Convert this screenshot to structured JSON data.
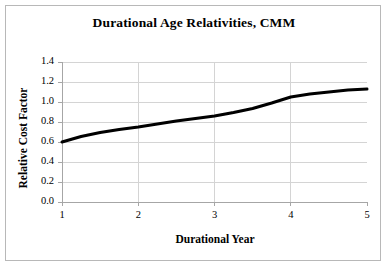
{
  "chart_data": {
    "type": "line",
    "title": "Durational Age Relativities, CMM",
    "xlabel": "Durational Year",
    "ylabel": "Relative Cost Factor",
    "xlim": [
      1,
      5
    ],
    "ylim": [
      0.0,
      1.4
    ],
    "grid": true,
    "legend": null,
    "xticks": [
      "1",
      "2",
      "3",
      "4",
      "5"
    ],
    "xtick_values": [
      1,
      2,
      3,
      4,
      5
    ],
    "yticks": [
      "0.0",
      "0.2",
      "0.4",
      "0.6",
      "0.8",
      "1.0",
      "1.2",
      "1.4"
    ],
    "ytick_values": [
      0.0,
      0.2,
      0.4,
      0.6,
      0.8,
      1.0,
      1.2,
      1.4
    ],
    "series": [
      {
        "name": "Relative Cost Factor",
        "color": "#000000",
        "line_width": 3,
        "x": [
          1.0,
          1.25,
          1.5,
          1.75,
          2.0,
          2.25,
          2.5,
          2.75,
          3.0,
          3.25,
          3.5,
          3.75,
          4.0,
          4.25,
          4.5,
          4.75,
          5.0
        ],
        "values": [
          0.6,
          0.655,
          0.695,
          0.725,
          0.75,
          0.78,
          0.81,
          0.835,
          0.86,
          0.895,
          0.935,
          0.99,
          1.05,
          1.08,
          1.1,
          1.12,
          1.13
        ]
      }
    ]
  },
  "style": {
    "line_color": "#000000",
    "grid_color": "#d4d4d4",
    "axis_color": "#a6a6a6",
    "border_color": "#b8b8b8",
    "background": "#ffffff"
  }
}
